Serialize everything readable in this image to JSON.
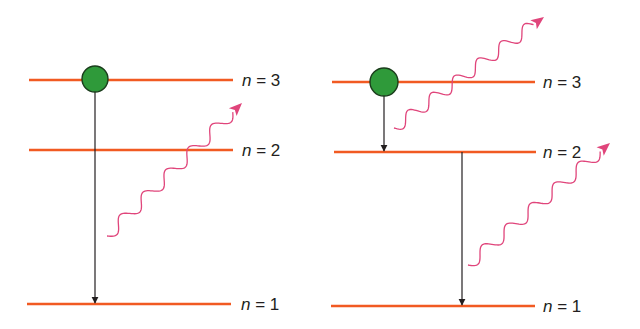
{
  "colors": {
    "level_line": "#f15a22",
    "electron_fill": "#2f9a3a",
    "electron_stroke": "#1b3d1c",
    "transition_arrow": "#231f20",
    "photon": "#e0457b",
    "label_text": "#231f20"
  },
  "panels": [
    {
      "id": "single-transition",
      "levels": [
        {
          "n": 3,
          "label_var": "n",
          "label_eq": " = 3"
        },
        {
          "n": 2,
          "label_var": "n",
          "label_eq": " = 2"
        },
        {
          "n": 1,
          "label_var": "n",
          "label_eq": " = 1"
        }
      ],
      "electron_level": 3,
      "transitions": [
        {
          "from": 3,
          "to": 1
        }
      ],
      "photons": 1
    },
    {
      "id": "cascade-transition",
      "levels": [
        {
          "n": 3,
          "label_var": "n",
          "label_eq": " = 3"
        },
        {
          "n": 2,
          "label_var": "n",
          "label_eq": " = 2"
        },
        {
          "n": 1,
          "label_var": "n",
          "label_eq": " = 1"
        }
      ],
      "electron_level": 3,
      "transitions": [
        {
          "from": 3,
          "to": 2
        },
        {
          "from": 2,
          "to": 1
        }
      ],
      "photons": 2
    }
  ]
}
